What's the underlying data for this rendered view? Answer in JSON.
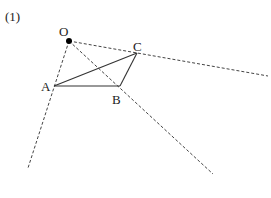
{
  "problem_label": "(1)",
  "points": {
    "O": {
      "label": "O",
      "x": 69,
      "y": 41
    },
    "A": {
      "label": "A",
      "x": 54,
      "y": 86
    },
    "B": {
      "label": "B",
      "x": 120,
      "y": 86
    },
    "C": {
      "label": "C",
      "x": 137,
      "y": 53
    }
  },
  "rays": [
    {
      "from": "O",
      "through": "A",
      "end": [
        28,
        168
      ]
    },
    {
      "from": "O",
      "through": "B",
      "end": [
        213,
        174
      ]
    },
    {
      "from": "O",
      "through": "C",
      "end": [
        268,
        76
      ]
    }
  ],
  "triangle": [
    "A",
    "B",
    "C"
  ],
  "colors": {
    "line": "#333333",
    "dash": "#444444",
    "point": "#000000"
  }
}
